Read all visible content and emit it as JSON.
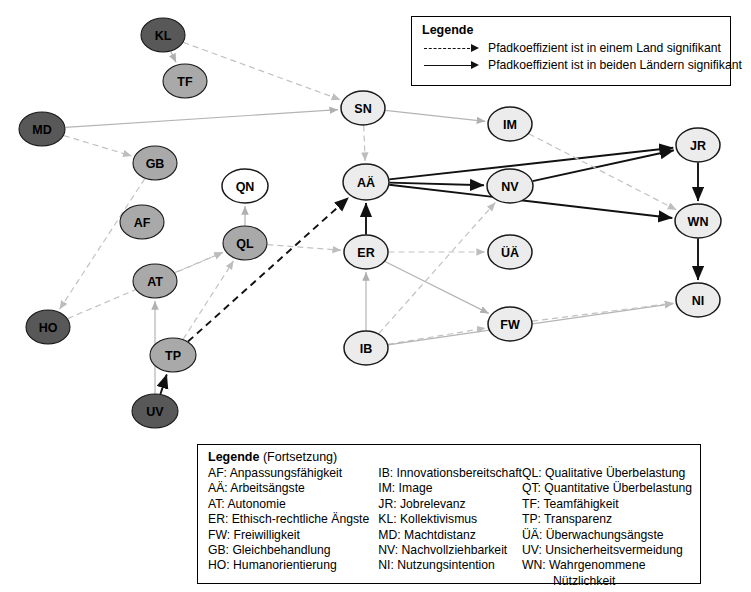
{
  "diagram": {
    "type": "path-model",
    "nodes": [
      {
        "id": "KL",
        "label": "KL",
        "x": 163,
        "y": 35,
        "rx": 22,
        "ry": 17,
        "shade": "dark"
      },
      {
        "id": "TF",
        "label": "TF",
        "x": 185,
        "y": 81,
        "rx": 22,
        "ry": 17,
        "shade": "medium"
      },
      {
        "id": "MD",
        "label": "MD",
        "x": 42,
        "y": 129,
        "rx": 23,
        "ry": 17,
        "shade": "dark"
      },
      {
        "id": "GB",
        "label": "GB",
        "x": 155,
        "y": 163,
        "rx": 22,
        "ry": 17,
        "shade": "medium"
      },
      {
        "id": "AF",
        "label": "AF",
        "x": 142,
        "y": 222,
        "rx": 22,
        "ry": 17,
        "shade": "medium"
      },
      {
        "id": "AT",
        "label": "AT",
        "x": 155,
        "y": 281,
        "rx": 22,
        "ry": 17,
        "shade": "medium"
      },
      {
        "id": "HO",
        "label": "HO",
        "x": 48,
        "y": 327,
        "rx": 22,
        "ry": 17,
        "shade": "dark"
      },
      {
        "id": "TP",
        "label": "TP",
        "x": 173,
        "y": 355,
        "rx": 23,
        "ry": 17,
        "shade": "medium"
      },
      {
        "id": "UV",
        "label": "UV",
        "x": 155,
        "y": 411,
        "rx": 23,
        "ry": 17,
        "shade": "dark"
      },
      {
        "id": "QN",
        "label": "QN",
        "x": 245,
        "y": 186,
        "rx": 23,
        "ry": 17,
        "shade": "white"
      },
      {
        "id": "QL",
        "label": "QL",
        "x": 245,
        "y": 243,
        "rx": 22,
        "ry": 17,
        "shade": "medium"
      },
      {
        "id": "SN",
        "label": "SN",
        "x": 363,
        "y": 108,
        "rx": 22,
        "ry": 17,
        "shade": "light"
      },
      {
        "id": "AA",
        "label": "AÄ",
        "x": 366,
        "y": 182,
        "rx": 23,
        "ry": 18,
        "shade": "light"
      },
      {
        "id": "ER",
        "label": "ER",
        "x": 366,
        "y": 252,
        "rx": 22,
        "ry": 17,
        "shade": "light"
      },
      {
        "id": "IB",
        "label": "IB",
        "x": 366,
        "y": 348,
        "rx": 22,
        "ry": 17,
        "shade": "light"
      },
      {
        "id": "IM",
        "label": "IM",
        "x": 510,
        "y": 124,
        "rx": 22,
        "ry": 17,
        "shade": "light"
      },
      {
        "id": "NV",
        "label": "NV",
        "x": 510,
        "y": 186,
        "rx": 23,
        "ry": 17,
        "shade": "light"
      },
      {
        "id": "UAE",
        "label": "ÜÄ",
        "x": 510,
        "y": 252,
        "rx": 22,
        "ry": 17,
        "shade": "light"
      },
      {
        "id": "FW",
        "label": "FW",
        "x": 510,
        "y": 324,
        "rx": 22,
        "ry": 17,
        "shade": "light"
      },
      {
        "id": "JR",
        "label": "JR",
        "x": 698,
        "y": 145,
        "rx": 22,
        "ry": 17,
        "shade": "light"
      },
      {
        "id": "WN",
        "label": "WN",
        "x": 698,
        "y": 221,
        "rx": 23,
        "ry": 17,
        "shade": "light"
      },
      {
        "id": "NI",
        "label": "NI",
        "x": 698,
        "y": 300,
        "rx": 22,
        "ry": 17,
        "shade": "light"
      }
    ],
    "edges": [
      {
        "from": "KL",
        "to": "TF",
        "style": "solid-thin"
      },
      {
        "from": "KL",
        "to": "SN",
        "style": "dashed-thin"
      },
      {
        "from": "MD",
        "to": "GB",
        "style": "dashed-thin"
      },
      {
        "from": "MD",
        "to": "SN",
        "style": "solid-thin"
      },
      {
        "from": "GB",
        "to": "HO",
        "style": "dashed-thin"
      },
      {
        "from": "HO",
        "to": "QL",
        "style": "dashed-thin"
      },
      {
        "from": "AT",
        "to": "QL",
        "style": "dashed-thin"
      },
      {
        "from": "UV",
        "to": "AT",
        "style": "solid-thin"
      },
      {
        "from": "UV",
        "to": "TP",
        "style": "solid-bold"
      },
      {
        "from": "TP",
        "to": "QL",
        "style": "dashed-thin"
      },
      {
        "from": "TP",
        "to": "AA",
        "style": "dashed-bold"
      },
      {
        "from": "QL",
        "to": "QN",
        "style": "solid-thin"
      },
      {
        "from": "QL",
        "to": "ER",
        "style": "dashed-thin"
      },
      {
        "from": "SN",
        "to": "IM",
        "style": "solid-thin"
      },
      {
        "from": "SN",
        "to": "AA",
        "style": "dashed-thin"
      },
      {
        "from": "AA",
        "to": "JR",
        "style": "solid-bold"
      },
      {
        "from": "AA",
        "to": "NV",
        "style": "solid-bold"
      },
      {
        "from": "AA",
        "to": "WN",
        "style": "solid-bold"
      },
      {
        "from": "ER",
        "to": "AA",
        "style": "solid-bold"
      },
      {
        "from": "ER",
        "to": "UAE",
        "style": "dashed-thin"
      },
      {
        "from": "ER",
        "to": "FW",
        "style": "solid-thin"
      },
      {
        "from": "IB",
        "to": "ER",
        "style": "solid-thin"
      },
      {
        "from": "IB",
        "to": "NV",
        "style": "dashed-thin"
      },
      {
        "from": "IB",
        "to": "FW",
        "style": "dashed-thin"
      },
      {
        "from": "IB",
        "to": "NI",
        "style": "solid-thin"
      },
      {
        "from": "NV",
        "to": "JR",
        "style": "solid-bold"
      },
      {
        "from": "IM",
        "to": "WN",
        "style": "dashed-thin"
      },
      {
        "from": "JR",
        "to": "WN",
        "style": "solid-bold"
      },
      {
        "from": "WN",
        "to": "NI",
        "style": "solid-bold"
      },
      {
        "from": "FW",
        "to": "NI",
        "style": "dashed-thin"
      }
    ],
    "colors": {
      "node_dark": "#585858",
      "node_medium": "#a9a9a9",
      "node_light": "#ececec",
      "node_white": "#ffffff",
      "node_stroke": "#1a1a1a",
      "edge_bold": "#111111",
      "edge_thin": "#b4b4b4",
      "edge_thin_dashed": "#c2c2c2"
    }
  },
  "legend_top": {
    "title": "Legende",
    "rows": [
      {
        "key": "dashed-arrow",
        "text": "Pfadkoeffizient ist in einem Land signifikant"
      },
      {
        "key": "solid-arrow",
        "text": "Pfadkoeffizient ist in beiden Ländern signifikant"
      }
    ]
  },
  "legend_bottom": {
    "title_bold": "Legende",
    "title_rest": " (Fortsetzung)",
    "col1": [
      "AF: Anpassungsfähigkeit",
      "AÄ: Arbeitsängste",
      "AT: Autonomie",
      "ER: Ethisch-rechtliche Ängste",
      "FW: Freiwilligkeit",
      "GB: Gleichbehandlung",
      "HO: Humanorientierung"
    ],
    "col2": [
      "IB: Innovationsbereitschaft",
      "IM: Image",
      "JR: Jobrelevanz",
      "KL: Kollektivismus",
      "MD: Machtdistanz",
      "NV: Nachvollziehbarkeit",
      "NI: Nutzungsintention"
    ],
    "col3": [
      "QL: Qualitative Überbelastung",
      "QT: Quantitative Überbelastung",
      "TF: Teamfähigkeit",
      "TP: Transparenz",
      "ÜÄ: Überwachungsängste",
      "UV: Unsicherheitsvermeidung",
      "WN: Wahrgenommene"
    ],
    "col3_wrap": "Nützlichkeit"
  }
}
